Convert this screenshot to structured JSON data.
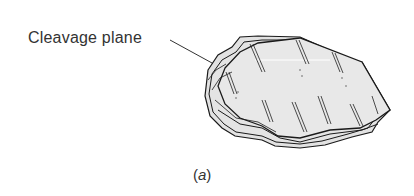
{
  "figure": {
    "label": "Cleavage plane",
    "caption_open": "(",
    "caption_letter": "a",
    "caption_close": ")",
    "colors": {
      "outline": "#1a1a1a",
      "fill": "#e6e6e6",
      "text": "#333333"
    }
  }
}
